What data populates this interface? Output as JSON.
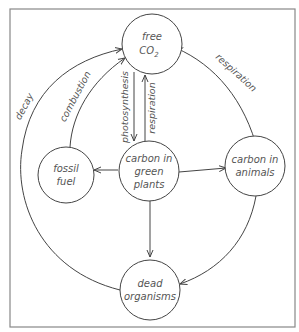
{
  "diagram": {
    "nodes": [
      {
        "id": "free_co2",
        "line1": "free",
        "line2": "CO",
        "sub": "2"
      },
      {
        "id": "fossil_fuel",
        "line1": "fossil",
        "line2": "fuel"
      },
      {
        "id": "green_plants",
        "line1": "carbon in",
        "line2": "green",
        "line3": "plants"
      },
      {
        "id": "animals",
        "line1": "carbon in",
        "line2": "animals"
      },
      {
        "id": "dead_organisms",
        "line1": "dead",
        "line2": "organisms"
      }
    ],
    "edges": [
      {
        "from": "dead_organisms",
        "to": "free_co2",
        "label": "decay"
      },
      {
        "from": "fossil_fuel",
        "to": "free_co2",
        "label": "combustion"
      },
      {
        "from": "free_co2",
        "to": "green_plants",
        "label": "photosynthesis"
      },
      {
        "from": "green_plants",
        "to": "free_co2",
        "label": "respiration"
      },
      {
        "from": "animals",
        "to": "free_co2",
        "label": "respiration"
      },
      {
        "from": "green_plants",
        "to": "fossil_fuel",
        "label": ""
      },
      {
        "from": "green_plants",
        "to": "animals",
        "label": ""
      },
      {
        "from": "green_plants",
        "to": "dead_organisms",
        "label": ""
      },
      {
        "from": "animals",
        "to": "dead_organisms",
        "label": ""
      }
    ]
  }
}
